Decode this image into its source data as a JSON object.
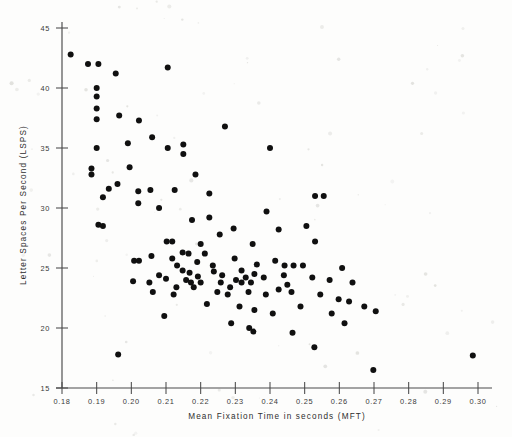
{
  "figure": {
    "kind": "scatter-plot",
    "background_color": "#fdfdfc",
    "point_color": "#101010",
    "axis_color": "#4a4a4a"
  },
  "axes": {
    "x_title": "Mean Fixation Time in seconds  (MFT)",
    "y_title": "Letter  Spaces  Per  Second  (LSPS)",
    "x_tick_labels": [
      "0.18",
      "0.19",
      "0.20",
      "0.21",
      "0.22",
      "0.23",
      "0.24",
      "0.25",
      "0.26",
      "0.27",
      "0.28",
      "0.29",
      "0.30"
    ],
    "y_tick_labels": [
      "15",
      "20",
      "25",
      "30",
      "35",
      "40",
      "45"
    ]
  },
  "chart_data": {
    "type": "scatter",
    "title": "",
    "xlabel": "Mean Fixation Time in seconds  (MFT)",
    "ylabel": "Letter  Spaces  Per  Second  (LSPS)",
    "xlim": [
      0.18,
      0.3
    ],
    "ylim": [
      1.5,
      4.5
    ],
    "xticks": [
      0.18,
      0.19,
      0.2,
      0.21,
      0.22,
      0.23,
      0.24,
      0.25,
      0.26,
      0.27,
      0.28,
      0.29,
      0.3
    ],
    "yticks": [
      1.5,
      2.0,
      2.5,
      3.0,
      3.5,
      4.0,
      4.5
    ],
    "xtick_labels": [
      "0.18",
      "0.19",
      "0.20",
      "0.21",
      "0.22",
      "0.23",
      "0.24",
      "0.25",
      "0.26",
      "0.27",
      "0.28",
      "0.29",
      "0.30"
    ],
    "ytick_labels": [
      "15",
      "20",
      "25",
      "30",
      "35",
      "40",
      "45"
    ],
    "grid": false,
    "legend": false,
    "marker": "filled-circle",
    "marker_size": 3.0,
    "n_points": 119,
    "series": [
      {
        "name": "readers",
        "color": "#101010",
        "points": [
          [
            0.1825,
            4.28
          ],
          [
            0.1875,
            4.2
          ],
          [
            0.1905,
            4.2
          ],
          [
            0.1955,
            4.12
          ],
          [
            0.2105,
            4.17
          ],
          [
            0.19,
            4.0
          ],
          [
            0.19,
            3.93
          ],
          [
            0.19,
            3.83
          ],
          [
            0.19,
            3.74
          ],
          [
            0.1965,
            3.77
          ],
          [
            0.2022,
            3.73
          ],
          [
            0.227,
            3.68
          ],
          [
            0.206,
            3.59
          ],
          [
            0.199,
            3.54
          ],
          [
            0.215,
            3.53
          ],
          [
            0.19,
            3.5
          ],
          [
            0.2105,
            3.5
          ],
          [
            0.24,
            3.5
          ],
          [
            0.215,
            3.45
          ],
          [
            0.1885,
            3.33
          ],
          [
            0.1885,
            3.28
          ],
          [
            0.1995,
            3.34
          ],
          [
            0.2185,
            3.28
          ],
          [
            0.1935,
            3.16
          ],
          [
            0.2055,
            3.15
          ],
          [
            0.2125,
            3.15
          ],
          [
            0.196,
            3.2
          ],
          [
            0.202,
            3.14
          ],
          [
            0.2225,
            3.12
          ],
          [
            0.253,
            3.1
          ],
          [
            0.2555,
            3.1
          ],
          [
            0.202,
            3.04
          ],
          [
            0.208,
            3.0
          ],
          [
            0.239,
            2.97
          ],
          [
            0.1918,
            3.09
          ],
          [
            0.1905,
            2.86
          ],
          [
            0.1918,
            2.85
          ],
          [
            0.2225,
            2.92
          ],
          [
            0.2175,
            2.9
          ],
          [
            0.2295,
            2.83
          ],
          [
            0.2425,
            2.82
          ],
          [
            0.2505,
            2.85
          ],
          [
            0.2102,
            2.72
          ],
          [
            0.2118,
            2.72
          ],
          [
            0.2255,
            2.78
          ],
          [
            0.22,
            2.7
          ],
          [
            0.235,
            2.7
          ],
          [
            0.253,
            2.72
          ],
          [
            0.2008,
            2.56
          ],
          [
            0.2022,
            2.56
          ],
          [
            0.2165,
            2.62
          ],
          [
            0.2118,
            2.58
          ],
          [
            0.219,
            2.55
          ],
          [
            0.2298,
            2.58
          ],
          [
            0.2362,
            2.53
          ],
          [
            0.2415,
            2.56
          ],
          [
            0.2468,
            2.52
          ],
          [
            0.2495,
            2.52
          ],
          [
            0.2148,
            2.48
          ],
          [
            0.2168,
            2.46
          ],
          [
            0.2238,
            2.47
          ],
          [
            0.2318,
            2.48
          ],
          [
            0.2355,
            2.45
          ],
          [
            0.2052,
            2.38
          ],
          [
            0.21,
            2.41
          ],
          [
            0.2158,
            2.4
          ],
          [
            0.2172,
            2.38
          ],
          [
            0.22,
            2.38
          ],
          [
            0.2258,
            2.38
          ],
          [
            0.2302,
            2.4
          ],
          [
            0.2318,
            2.38
          ],
          [
            0.233,
            2.42
          ],
          [
            0.2345,
            2.38
          ],
          [
            0.2382,
            2.42
          ],
          [
            0.244,
            2.44
          ],
          [
            0.2522,
            2.42
          ],
          [
            0.2572,
            2.4
          ],
          [
            0.2005,
            2.39
          ],
          [
            0.2062,
            2.3
          ],
          [
            0.2122,
            2.28
          ],
          [
            0.2248,
            2.3
          ],
          [
            0.2278,
            2.28
          ],
          [
            0.2338,
            2.3
          ],
          [
            0.2425,
            2.32
          ],
          [
            0.2462,
            2.3
          ],
          [
            0.2545,
            2.28
          ],
          [
            0.2598,
            2.24
          ],
          [
            0.2628,
            2.22
          ],
          [
            0.2672,
            2.18
          ],
          [
            0.2218,
            2.2
          ],
          [
            0.2312,
            2.18
          ],
          [
            0.2355,
            2.15
          ],
          [
            0.2408,
            2.12
          ],
          [
            0.2095,
            2.1
          ],
          [
            0.2288,
            2.04
          ],
          [
            0.234,
            2.0
          ],
          [
            0.2352,
            1.97
          ],
          [
            0.2465,
            1.96
          ],
          [
            0.2615,
            2.04
          ],
          [
            0.2705,
            2.14
          ],
          [
            0.2528,
            1.84
          ],
          [
            0.2698,
            1.65
          ],
          [
            0.1962,
            1.78
          ],
          [
            0.2985,
            1.77
          ],
          [
            0.2148,
            2.63
          ],
          [
            0.2212,
            2.62
          ],
          [
            0.2442,
            2.52
          ],
          [
            0.208,
            2.44
          ],
          [
            0.2285,
            2.34
          ],
          [
            0.218,
            2.34
          ],
          [
            0.2235,
            2.52
          ],
          [
            0.2608,
            2.5
          ],
          [
            0.245,
            2.36
          ],
          [
            0.2638,
            2.38
          ],
          [
            0.2388,
            2.28
          ],
          [
            0.2192,
            2.43
          ],
          [
            0.2262,
            2.44
          ],
          [
            0.213,
            2.34
          ],
          [
            0.2488,
            2.18
          ],
          [
            0.2578,
            2.12
          ],
          [
            0.2132,
            2.52
          ],
          [
            0.2058,
            2.6
          ]
        ]
      }
    ]
  }
}
